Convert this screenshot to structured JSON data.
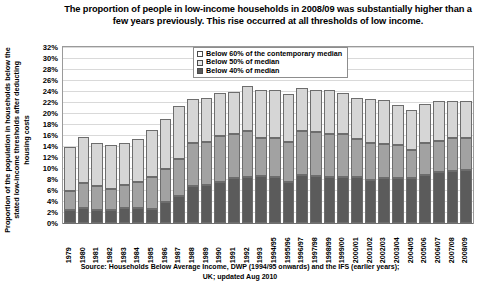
{
  "title": "The proportion of people in low-income households in 2008/09 was substantially higher than a few years previously.  This rise occurred at all thresholds of low income.",
  "axis": {
    "y_title": "Proportion of the population in households below the stated low-income thresholds after deducting housing costs",
    "y_ticks": [
      "0%",
      "2%",
      "4%",
      "6%",
      "8%",
      "10%",
      "12%",
      "14%",
      "16%",
      "18%",
      "20%",
      "22%",
      "24%",
      "26%",
      "28%",
      "30%",
      "32%"
    ]
  },
  "legend": {
    "items": [
      {
        "label": "Below 60% of the contemporary median",
        "color": "#ffffff",
        "swatch": "w60"
      },
      {
        "label": "Below 50% of median",
        "color": "#e6e6e6",
        "swatch": "w50"
      },
      {
        "label": "Below 40% of median",
        "color": "#5b5b5b",
        "swatch": "w40"
      }
    ]
  },
  "source": {
    "line1": "Source: Households Below Average Income, DWP (1994/95 onwards) and the IFS (earlier years);",
    "line2": "UK; updated Aug 2010"
  },
  "chart_data": {
    "type": "bar",
    "stacked": true,
    "title": "The proportion of people in low-income households in 2008/09 was substantially higher than a few years previously.  This rise occurred at all thresholds of low income.",
    "xlabel": "",
    "ylabel": "Proportion of the population in households below the stated low-income thresholds after deducting housing costs",
    "ylim": [
      0,
      32
    ],
    "ytick_step": 2,
    "grid": true,
    "legend_position": "top-center",
    "categories": [
      "1979",
      "1980",
      "1981",
      "1982",
      "1983",
      "1984",
      "1985",
      "1986",
      "1987",
      "1988",
      "1989",
      "1990",
      "1991",
      "1992",
      "1993",
      "1994/95",
      "1995/96",
      "1996/97",
      "1997/98",
      "1998/99",
      "1999/00",
      "2000/01",
      "2001/02",
      "2002/03",
      "2003/04",
      "2004/05",
      "2005/06",
      "2006/07",
      "2007/08",
      "2008/09"
    ],
    "series": [
      {
        "name": "Below 40% of median",
        "color": "#5b5b5b",
        "values": [
          2.3,
          2.8,
          2.4,
          2.4,
          2.8,
          2.8,
          2.6,
          3.9,
          5.0,
          6.7,
          7.0,
          7.4,
          8.2,
          8.4,
          8.5,
          8.4,
          7.5,
          8.7,
          8.5,
          8.3,
          8.4,
          8.4,
          7.9,
          8.2,
          8.2,
          8.1,
          8.7,
          9.3,
          9.5,
          9.7
        ]
      },
      {
        "name": "Below 50% of median",
        "color": "#a2a2a2",
        "values": [
          3.6,
          4.5,
          4.4,
          3.7,
          4.2,
          4.6,
          5.7,
          6.0,
          6.7,
          7.9,
          7.8,
          8.5,
          8.0,
          8.3,
          7.0,
          7.0,
          7.2,
          8.1,
          8.0,
          7.8,
          7.7,
          6.8,
          6.7,
          6.2,
          5.9,
          5.2,
          5.8,
          5.6,
          5.9,
          5.8
        ]
      },
      {
        "name": "Below 60% of the contemporary median",
        "color": "#d6d6d6",
        "values": [
          7.9,
          8.3,
          7.7,
          8.0,
          7.5,
          7.9,
          8.6,
          9.0,
          9.5,
          8.0,
          8.0,
          7.8,
          7.6,
          8.2,
          8.6,
          8.7,
          8.7,
          7.7,
          7.7,
          8.1,
          7.6,
          7.6,
          7.9,
          7.9,
          7.3,
          7.2,
          7.1,
          7.2,
          6.8,
          6.6
        ]
      }
    ]
  }
}
